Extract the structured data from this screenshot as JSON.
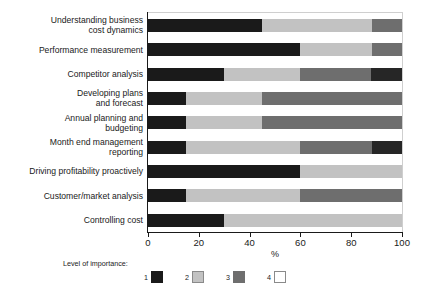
{
  "chart_data": {
    "type": "bar",
    "orientation": "horizontal",
    "stacked": true,
    "normalized_percent": true,
    "title": "",
    "xlabel": "%",
    "ylabel": "",
    "xlim": [
      0,
      100
    ],
    "xticks": [
      0,
      20,
      40,
      60,
      80,
      100
    ],
    "xtick_labels": [
      "0",
      "20",
      "40",
      "60",
      "80",
      "100"
    ],
    "grid": false,
    "legend_title": "Level of importance:",
    "legend_position": "bottom",
    "categories": [
      "Understanding business cost dynamics",
      "Performance measurement",
      "Competitor analysis",
      "Developing plans and forecast",
      "Annual planning and budgeting",
      "Month end management reporting",
      "Driving profitability proactively",
      "Customer/market analysis",
      "Controlling cost"
    ],
    "category_labels_wrapped": [
      "Understanding business\ncost dynamics",
      "Performance measurement",
      "Competitor analysis",
      "Developing plans\nand forecast",
      "Annual planning and\nbudgeting",
      "Month end management\nreporting",
      "Driving profitability proactively",
      "Customer/market analysis",
      "Controlling cost"
    ],
    "series": [
      {
        "name": "1",
        "color": "#1a1a1a",
        "values": [
          45,
          60,
          30,
          15,
          15,
          15,
          60,
          15,
          30
        ]
      },
      {
        "name": "2",
        "color": "#c2c2c2",
        "values": [
          43,
          28,
          30,
          30,
          30,
          45,
          40,
          45,
          70
        ]
      },
      {
        "name": "3",
        "color": "#6e6e6e",
        "values": [
          12,
          12,
          28,
          55,
          55,
          28,
          0,
          40,
          0
        ]
      },
      {
        "name": "4",
        "color": "#ffffff",
        "values": [
          0,
          0,
          12,
          0,
          0,
          12,
          0,
          0,
          0
        ]
      }
    ],
    "bars": [
      {
        "label": "Understanding business cost dynamics",
        "segments": [
          {
            "series": "1",
            "value": 45,
            "class": "c1"
          },
          {
            "series": "2",
            "value": 43,
            "class": "c2"
          },
          {
            "series": "3",
            "value": 12,
            "class": "c3"
          }
        ]
      },
      {
        "label": "Performance measurement",
        "segments": [
          {
            "series": "1",
            "value": 60,
            "class": "c1"
          },
          {
            "series": "2",
            "value": 28,
            "class": "c2"
          },
          {
            "series": "3",
            "value": 12,
            "class": "c3"
          }
        ]
      },
      {
        "label": "Competitor analysis",
        "segments": [
          {
            "series": "1",
            "value": 30,
            "class": "c1"
          },
          {
            "series": "2",
            "value": 30,
            "class": "c2"
          },
          {
            "series": "3",
            "value": 28,
            "class": "c3"
          },
          {
            "series": "4",
            "value": 12,
            "class": "c1b"
          }
        ]
      },
      {
        "label": "Developing plans and forecast",
        "segments": [
          {
            "series": "1",
            "value": 15,
            "class": "c1"
          },
          {
            "series": "2",
            "value": 30,
            "class": "c2"
          },
          {
            "series": "3",
            "value": 55,
            "class": "c3"
          }
        ]
      },
      {
        "label": "Annual planning and budgeting",
        "segments": [
          {
            "series": "1",
            "value": 15,
            "class": "c1"
          },
          {
            "series": "2",
            "value": 30,
            "class": "c2"
          },
          {
            "series": "3",
            "value": 55,
            "class": "c3"
          }
        ]
      },
      {
        "label": "Month end management reporting",
        "segments": [
          {
            "series": "1",
            "value": 15,
            "class": "c1"
          },
          {
            "series": "2",
            "value": 45,
            "class": "c2"
          },
          {
            "series": "3",
            "value": 28,
            "class": "c3"
          },
          {
            "series": "4",
            "value": 12,
            "class": "c1b"
          }
        ]
      },
      {
        "label": "Driving profitability proactively",
        "segments": [
          {
            "series": "1",
            "value": 60,
            "class": "c1"
          },
          {
            "series": "2",
            "value": 40,
            "class": "c2"
          }
        ]
      },
      {
        "label": "Customer/market analysis",
        "segments": [
          {
            "series": "1",
            "value": 15,
            "class": "c1"
          },
          {
            "series": "2",
            "value": 45,
            "class": "c2"
          },
          {
            "series": "3",
            "value": 40,
            "class": "c3"
          }
        ]
      },
      {
        "label": "Controlling cost",
        "segments": [
          {
            "series": "1",
            "value": 30,
            "class": "c1"
          },
          {
            "series": "2",
            "value": 70,
            "class": "c2"
          }
        ]
      }
    ],
    "legend_entries": [
      {
        "label": "1",
        "color": "#1a1a1a",
        "swatch_class": "sw-c1"
      },
      {
        "label": "2",
        "color": "#c2c2c2",
        "swatch_class": "sw-c2"
      },
      {
        "label": "3",
        "color": "#6e6e6e",
        "swatch_class": "sw-c3"
      },
      {
        "label": "4",
        "color": "#ffffff",
        "swatch_class": "sw-c4"
      }
    ]
  },
  "labels": {
    "cat_0": "Understanding business\ncost dynamics",
    "cat_1": "Performance measurement",
    "cat_2": "Competitor analysis",
    "cat_3": "Developing plans\nand forecast",
    "cat_4": "Annual planning and\nbudgeting",
    "cat_5": "Month end management\nreporting",
    "cat_6": "Driving profitability proactively",
    "cat_7": "Customer/market analysis",
    "cat_8": "Controlling cost"
  },
  "axis": {
    "x_title": "%",
    "tick_0": "0",
    "tick_1": "20",
    "tick_2": "40",
    "tick_3": "60",
    "tick_4": "80",
    "tick_5": "100"
  },
  "legend": {
    "title": "Level of importance:",
    "item_0": "1",
    "item_1": "2",
    "item_2": "3",
    "item_3": "4"
  },
  "colors": {
    "level_1": "#1a1a1a",
    "level_2": "#c2c2c2",
    "level_3": "#6e6e6e",
    "level_4": "#ffffff",
    "axis": "#1a1a1a",
    "background": "#ffffff"
  }
}
